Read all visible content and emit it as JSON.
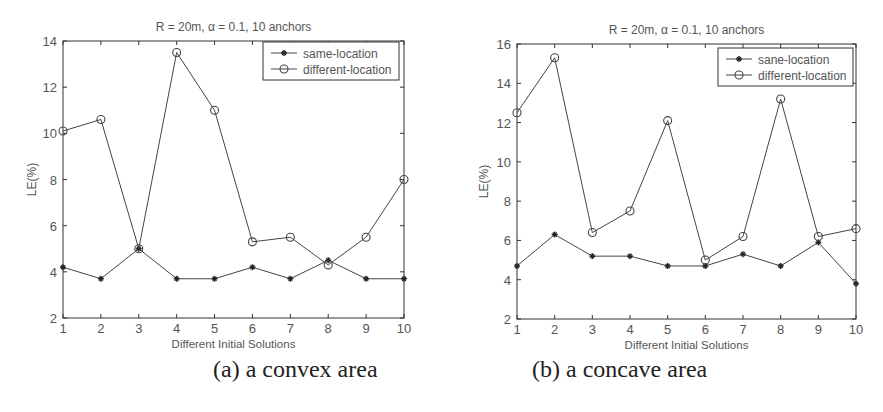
{
  "figure": {
    "captions": [
      "(a)  a convex area",
      "(b)  a concave area"
    ]
  },
  "chart_data": [
    {
      "type": "line",
      "title": "R = 20m, α = 0.1, 10 anchors",
      "xlabel": "Different Initial Solutions",
      "ylabel": "LE(%)",
      "x": [
        1,
        2,
        3,
        4,
        5,
        6,
        7,
        8,
        9,
        10
      ],
      "xlim": [
        1,
        10
      ],
      "ylim": [
        2,
        14
      ],
      "yticks": [
        2,
        4,
        6,
        8,
        10,
        12,
        14
      ],
      "xticks": [
        1,
        2,
        3,
        4,
        5,
        6,
        7,
        8,
        9,
        10
      ],
      "grid": false,
      "legend_position": "upper right",
      "series": [
        {
          "name": "same-location",
          "marker": "asterisk",
          "values": [
            4.2,
            3.7,
            5.0,
            3.7,
            3.7,
            4.2,
            3.7,
            4.5,
            3.7,
            3.7
          ]
        },
        {
          "name": "different-location",
          "marker": "circle",
          "values": [
            10.1,
            10.6,
            5.0,
            13.5,
            11.0,
            5.3,
            5.5,
            4.3,
            5.5,
            8.0
          ]
        }
      ],
      "caption": "(a)  a convex area"
    },
    {
      "type": "line",
      "title": "R = 20m, α = 0.1, 10 anchors",
      "xlabel": "Different Initial Solutions",
      "ylabel": "LE(%)",
      "x": [
        1,
        2,
        3,
        4,
        5,
        6,
        7,
        8,
        9,
        10
      ],
      "xlim": [
        1,
        10
      ],
      "ylim": [
        2,
        16
      ],
      "yticks": [
        2,
        4,
        6,
        8,
        10,
        12,
        14,
        16
      ],
      "xticks": [
        1,
        2,
        3,
        4,
        5,
        6,
        7,
        8,
        9,
        10
      ],
      "grid": false,
      "legend_position": "upper right",
      "series": [
        {
          "name": "sane-location",
          "marker": "asterisk",
          "values": [
            4.7,
            6.3,
            5.2,
            5.2,
            4.7,
            4.7,
            5.3,
            4.7,
            5.9,
            3.8
          ]
        },
        {
          "name": "different-location",
          "marker": "circle",
          "values": [
            12.5,
            15.3,
            6.4,
            7.5,
            12.1,
            5.0,
            6.2,
            13.2,
            6.2,
            6.6
          ]
        }
      ],
      "caption": "(b)  a concave area"
    }
  ],
  "colors": {
    "axis": "#333333",
    "line": "#444444",
    "text": "#555555"
  }
}
